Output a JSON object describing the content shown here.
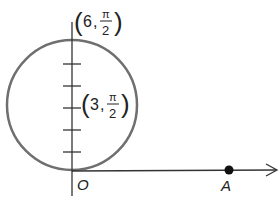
{
  "diagram": {
    "labels": {
      "top_point": {
        "r": "6",
        "theta_num": "π",
        "theta_den": "2"
      },
      "center_point": {
        "r": "3",
        "theta_num": "π",
        "theta_den": "2"
      },
      "origin": "O",
      "point_a": "A"
    },
    "colors": {
      "circle": "#707070",
      "axis": "#333333",
      "point": "#111111"
    }
  }
}
